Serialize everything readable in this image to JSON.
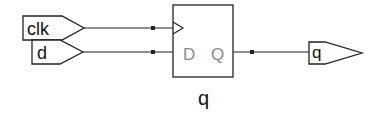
{
  "diagram": {
    "type": "schematic",
    "inputs": [
      {
        "name": "clk",
        "label": "clk"
      },
      {
        "name": "d",
        "label": "d"
      }
    ],
    "outputs": [
      {
        "name": "q",
        "label": "q"
      }
    ],
    "flipflop": {
      "pin_d": "D",
      "pin_q": "Q",
      "instance_label": "q"
    },
    "colors": {
      "stroke": "#222222",
      "pin_text": "#8a8a8a",
      "background": "#ffffff"
    }
  }
}
